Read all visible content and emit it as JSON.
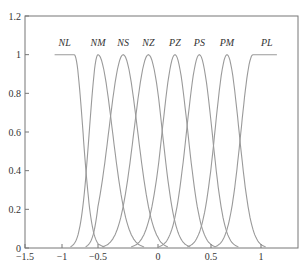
{
  "chart_data": {
    "type": "line",
    "title": "",
    "xlabel": "",
    "ylabel": "",
    "xlim": [
      -1.5,
      1.35
    ],
    "ylim": [
      0,
      1.2
    ],
    "grid": false,
    "legend": "none",
    "x_ticks": [
      -1.5,
      -1,
      -0.5,
      0,
      0.5,
      1
    ],
    "x_tick_labels": [
      "−1.5",
      "−1",
      "−0.5",
      "0",
      "0.5",
      "1"
    ],
    "y_ticks": [
      0,
      0.2,
      0.4,
      0.6,
      0.8,
      1,
      1.2
    ],
    "y_tick_labels": [
      "0",
      "0.2",
      "0.4",
      "0.6",
      "0.8",
      "1",
      "1.2"
    ],
    "membership_functions": [
      {
        "name": "NL",
        "shape": "left-shoulder-gaussian",
        "center": -0.83,
        "sigma": 0.12,
        "flat_from": -1.1
      },
      {
        "name": "NM",
        "shape": "gaussian",
        "center": -0.5,
        "sigma": 0.12
      },
      {
        "name": "NS",
        "shape": "gaussian",
        "center": -0.29,
        "sigma": 0.12
      },
      {
        "name": "NZ",
        "shape": "gaussian",
        "center": -0.08,
        "sigma": 0.12
      },
      {
        "name": "PZ",
        "shape": "gaussian",
        "center": 0.16,
        "sigma": 0.12
      },
      {
        "name": "PS",
        "shape": "gaussian",
        "center": 0.39,
        "sigma": 0.12
      },
      {
        "name": "PM",
        "shape": "gaussian",
        "center": 0.66,
        "sigma": 0.12
      },
      {
        "name": "PL",
        "shape": "right-shoulder-gaussian",
        "center": 0.92,
        "sigma": 0.12,
        "flat_to": 1.15
      }
    ],
    "peak_value": 1
  }
}
